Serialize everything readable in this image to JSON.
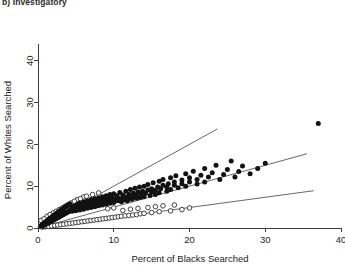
{
  "panel": {
    "title": "b) Investigatory"
  },
  "chart_data": {
    "type": "scatter",
    "title": "b) Investigatory",
    "xlabel": "Percent of Blacks Searched",
    "ylabel": "Percent of Whites Searched",
    "xlim": [
      0,
      40
    ],
    "ylim": [
      0,
      44
    ],
    "xticks": [
      0,
      10,
      20,
      30,
      40
    ],
    "yticks": [
      0,
      10,
      20,
      30,
      40
    ],
    "xtick_labels": [
      "0",
      "10",
      "20",
      "30",
      "40"
    ],
    "ytick_labels": [
      "0",
      "10",
      "20",
      "30",
      "40"
    ],
    "grid": false,
    "legend": null,
    "reference_lines": [
      {
        "name": "upper-line",
        "slope": 1.0,
        "intercept": 0.0,
        "x_start": 0.0,
        "x_end": 23.7
      },
      {
        "name": "middle-line",
        "slope": 0.5,
        "intercept": 0.0,
        "x_start": 0.0,
        "x_end": 35.5
      },
      {
        "name": "lower-line",
        "slope": 0.245,
        "intercept": 0.0,
        "x_start": 0.0,
        "x_end": 36.4
      }
    ],
    "series": [
      {
        "name": "filled-points",
        "marker": "filled-circle",
        "color": "#121212",
        "points": [
          [
            0.3,
            0.3
          ],
          [
            0.4,
            0.5
          ],
          [
            0.5,
            0.4
          ],
          [
            0.5,
            0.7
          ],
          [
            0.6,
            0.5
          ],
          [
            0.6,
            0.9
          ],
          [
            0.7,
            0.6
          ],
          [
            0.7,
            1.0
          ],
          [
            0.8,
            0.7
          ],
          [
            0.8,
            1.1
          ],
          [
            0.9,
            0.8
          ],
          [
            0.9,
            1.3
          ],
          [
            1.0,
            0.9
          ],
          [
            1.0,
            1.4
          ],
          [
            1.1,
            1.0
          ],
          [
            1.1,
            1.6
          ],
          [
            1.2,
            1.1
          ],
          [
            1.2,
            1.7
          ],
          [
            1.3,
            1.2
          ],
          [
            1.3,
            1.9
          ],
          [
            1.4,
            1.3
          ],
          [
            1.4,
            2.0
          ],
          [
            1.5,
            1.4
          ],
          [
            1.5,
            2.2
          ],
          [
            1.6,
            1.5
          ],
          [
            1.6,
            2.3
          ],
          [
            1.7,
            1.6
          ],
          [
            1.7,
            2.4
          ],
          [
            1.8,
            1.7
          ],
          [
            1.8,
            2.6
          ],
          [
            1.9,
            1.8
          ],
          [
            1.9,
            2.7
          ],
          [
            2.0,
            1.9
          ],
          [
            2.0,
            2.9
          ],
          [
            2.1,
            2.0
          ],
          [
            2.1,
            3.0
          ],
          [
            2.2,
            2.1
          ],
          [
            2.2,
            3.1
          ],
          [
            2.3,
            2.2
          ],
          [
            2.3,
            3.3
          ],
          [
            2.4,
            2.3
          ],
          [
            2.4,
            3.4
          ],
          [
            2.5,
            2.4
          ],
          [
            2.5,
            3.5
          ],
          [
            2.6,
            2.5
          ],
          [
            2.6,
            3.7
          ],
          [
            2.7,
            2.6
          ],
          [
            2.7,
            3.8
          ],
          [
            2.8,
            2.7
          ],
          [
            2.8,
            3.9
          ],
          [
            2.9,
            2.8
          ],
          [
            2.9,
            4.1
          ],
          [
            3.0,
            2.9
          ],
          [
            3.0,
            4.2
          ],
          [
            3.1,
            3.0
          ],
          [
            3.1,
            4.3
          ],
          [
            3.2,
            3.1
          ],
          [
            3.2,
            4.5
          ],
          [
            3.3,
            3.2
          ],
          [
            3.3,
            4.6
          ],
          [
            3.4,
            3.3
          ],
          [
            3.4,
            4.7
          ],
          [
            3.5,
            3.4
          ],
          [
            3.5,
            4.9
          ],
          [
            3.6,
            3.5
          ],
          [
            3.6,
            5.0
          ],
          [
            3.7,
            3.6
          ],
          [
            3.7,
            5.1
          ],
          [
            3.8,
            3.7
          ],
          [
            3.8,
            5.3
          ],
          [
            3.9,
            3.8
          ],
          [
            3.9,
            5.4
          ],
          [
            4.0,
            3.9
          ],
          [
            4.0,
            5.5
          ],
          [
            4.1,
            4.0
          ],
          [
            4.2,
            4.2
          ],
          [
            4.2,
            5.8
          ],
          [
            4.3,
            4.3
          ],
          [
            4.4,
            4.5
          ],
          [
            4.5,
            4.0
          ],
          [
            4.5,
            5.2
          ],
          [
            4.6,
            4.7
          ],
          [
            4.7,
            4.2
          ],
          [
            4.8,
            5.0
          ],
          [
            4.9,
            4.4
          ],
          [
            5.0,
            5.4
          ],
          [
            5.0,
            4.1
          ],
          [
            5.1,
            4.8
          ],
          [
            5.2,
            5.6
          ],
          [
            5.3,
            4.5
          ],
          [
            5.4,
            5.2
          ],
          [
            5.5,
            6.0
          ],
          [
            5.5,
            4.3
          ],
          [
            5.6,
            5.0
          ],
          [
            5.7,
            5.8
          ],
          [
            5.8,
            4.7
          ],
          [
            5.9,
            5.4
          ],
          [
            6.0,
            6.2
          ],
          [
            6.0,
            4.5
          ],
          [
            6.1,
            5.2
          ],
          [
            6.2,
            6.0
          ],
          [
            6.3,
            4.9
          ],
          [
            6.4,
            5.6
          ],
          [
            6.5,
            6.5
          ],
          [
            6.5,
            4.7
          ],
          [
            6.6,
            5.4
          ],
          [
            6.7,
            6.2
          ],
          [
            6.8,
            5.1
          ],
          [
            6.9,
            5.8
          ],
          [
            7.0,
            6.8
          ],
          [
            7.0,
            4.9
          ],
          [
            7.1,
            5.6
          ],
          [
            7.2,
            6.4
          ],
          [
            7.3,
            5.3
          ],
          [
            7.4,
            6.0
          ],
          [
            7.5,
            7.0
          ],
          [
            7.5,
            5.1
          ],
          [
            7.6,
            5.8
          ],
          [
            7.7,
            6.6
          ],
          [
            7.8,
            5.5
          ],
          [
            7.9,
            6.2
          ],
          [
            8.0,
            7.2
          ],
          [
            8.0,
            5.3
          ],
          [
            8.1,
            6.0
          ],
          [
            8.2,
            6.8
          ],
          [
            8.3,
            5.7
          ],
          [
            8.4,
            6.4
          ],
          [
            8.5,
            7.5
          ],
          [
            8.5,
            5.5
          ],
          [
            8.6,
            6.2
          ],
          [
            8.7,
            7.0
          ],
          [
            8.8,
            5.9
          ],
          [
            8.9,
            6.6
          ],
          [
            9.0,
            7.7
          ],
          [
            9.0,
            5.7
          ],
          [
            9.1,
            6.4
          ],
          [
            9.2,
            7.2
          ],
          [
            9.3,
            6.1
          ],
          [
            9.4,
            6.8
          ],
          [
            9.5,
            8.0
          ],
          [
            9.5,
            5.9
          ],
          [
            9.6,
            6.6
          ],
          [
            9.7,
            7.5
          ],
          [
            9.8,
            6.3
          ],
          [
            9.9,
            7.0
          ],
          [
            10.0,
            8.2
          ],
          [
            10.0,
            6.1
          ],
          [
            10.2,
            6.8
          ],
          [
            10.4,
            7.7
          ],
          [
            10.5,
            6.5
          ],
          [
            10.6,
            7.2
          ],
          [
            10.8,
            8.5
          ],
          [
            11.0,
            6.3
          ],
          [
            11.0,
            7.0
          ],
          [
            11.2,
            7.9
          ],
          [
            11.4,
            6.7
          ],
          [
            11.5,
            7.4
          ],
          [
            11.6,
            8.8
          ],
          [
            11.8,
            6.5
          ],
          [
            12.0,
            7.2
          ],
          [
            12.0,
            8.1
          ],
          [
            12.2,
            9.2
          ],
          [
            12.4,
            6.9
          ],
          [
            12.5,
            7.6
          ],
          [
            12.6,
            8.3
          ],
          [
            12.8,
            9.5
          ],
          [
            13.0,
            7.1
          ],
          [
            13.0,
            7.8
          ],
          [
            13.2,
            8.6
          ],
          [
            13.4,
            9.8
          ],
          [
            13.5,
            7.3
          ],
          [
            13.6,
            8.0
          ],
          [
            13.8,
            8.8
          ],
          [
            14.0,
            10.0
          ],
          [
            14.0,
            7.5
          ],
          [
            14.2,
            8.3
          ],
          [
            14.5,
            9.1
          ],
          [
            14.5,
            10.4
          ],
          [
            14.8,
            7.8
          ],
          [
            15.0,
            8.6
          ],
          [
            15.0,
            9.4
          ],
          [
            15.2,
            10.8
          ],
          [
            15.5,
            8.0
          ],
          [
            15.5,
            9.0
          ],
          [
            15.8,
            9.8
          ],
          [
            16.0,
            11.2
          ],
          [
            16.0,
            8.4
          ],
          [
            16.2,
            9.4
          ],
          [
            16.5,
            10.2
          ],
          [
            16.5,
            11.6
          ],
          [
            17.0,
            8.8
          ],
          [
            17.0,
            9.8
          ],
          [
            17.2,
            10.6
          ],
          [
            17.5,
            12.0
          ],
          [
            17.5,
            9.2
          ],
          [
            18.0,
            10.2
          ],
          [
            18.0,
            11.0
          ],
          [
            18.2,
            12.5
          ],
          [
            18.5,
            9.6
          ],
          [
            19.0,
            10.6
          ],
          [
            19.0,
            11.5
          ],
          [
            19.5,
            13.0
          ],
          [
            19.5,
            10.0
          ],
          [
            20.0,
            11.0
          ],
          [
            20.0,
            12.0
          ],
          [
            20.5,
            13.6
          ],
          [
            21.0,
            10.5
          ],
          [
            21.0,
            11.6
          ],
          [
            21.5,
            12.6
          ],
          [
            22.0,
            14.2
          ],
          [
            22.0,
            11.0
          ],
          [
            22.5,
            12.2
          ],
          [
            23.0,
            13.2
          ],
          [
            23.5,
            15.0
          ],
          [
            24.0,
            11.6
          ],
          [
            24.5,
            12.8
          ],
          [
            25.0,
            14.0
          ],
          [
            25.5,
            16.0
          ],
          [
            26.0,
            12.2
          ],
          [
            26.5,
            13.5
          ],
          [
            27.0,
            14.8
          ],
          [
            28.0,
            13.0
          ],
          [
            29.0,
            14.2
          ],
          [
            30.0,
            15.5
          ],
          [
            37.0,
            25.0
          ]
        ]
      },
      {
        "name": "open-points",
        "marker": "open-circle",
        "color": "#ffffff",
        "points": [
          [
            0.6,
            0.2
          ],
          [
            1.0,
            0.3
          ],
          [
            1.4,
            0.4
          ],
          [
            1.8,
            0.5
          ],
          [
            2.2,
            0.6
          ],
          [
            2.6,
            0.7
          ],
          [
            3.0,
            0.8
          ],
          [
            3.4,
            0.9
          ],
          [
            3.8,
            1.0
          ],
          [
            4.2,
            1.1
          ],
          [
            4.6,
            1.2
          ],
          [
            5.0,
            1.3
          ],
          [
            5.4,
            1.4
          ],
          [
            5.8,
            1.5
          ],
          [
            6.2,
            1.6
          ],
          [
            6.6,
            1.7
          ],
          [
            7.0,
            1.8
          ],
          [
            7.4,
            1.9
          ],
          [
            7.8,
            2.0
          ],
          [
            8.2,
            2.1
          ],
          [
            8.6,
            2.2
          ],
          [
            9.0,
            2.3
          ],
          [
            9.4,
            2.4
          ],
          [
            9.8,
            2.5
          ],
          [
            10.2,
            2.6
          ],
          [
            10.6,
            2.7
          ],
          [
            11.0,
            2.8
          ],
          [
            11.5,
            2.9
          ],
          [
            12.0,
            3.0
          ],
          [
            12.5,
            3.1
          ],
          [
            13.0,
            3.2
          ],
          [
            13.5,
            3.4
          ],
          [
            14.0,
            3.5
          ],
          [
            15.0,
            3.7
          ],
          [
            16.0,
            3.9
          ],
          [
            17.5,
            4.1
          ],
          [
            19.0,
            4.4
          ],
          [
            1.2,
            2.8
          ],
          [
            2.0,
            3.6
          ],
          [
            2.8,
            4.4
          ],
          [
            3.6,
            5.2
          ],
          [
            4.4,
            6.0
          ],
          [
            5.2,
            6.8
          ],
          [
            6.0,
            7.4
          ],
          [
            7.2,
            8.0
          ],
          [
            0.4,
            1.8
          ],
          [
            0.8,
            2.2
          ],
          [
            1.6,
            3.2
          ],
          [
            2.4,
            4.0
          ],
          [
            3.2,
            4.8
          ],
          [
            4.0,
            5.6
          ],
          [
            4.8,
            6.4
          ],
          [
            5.6,
            7.0
          ],
          [
            6.4,
            7.6
          ],
          [
            8.0,
            8.4
          ],
          [
            9.2,
            4.6
          ],
          [
            10.0,
            4.8
          ],
          [
            11.2,
            4.2
          ],
          [
            12.2,
            4.5
          ],
          [
            13.2,
            4.7
          ],
          [
            14.5,
            4.9
          ],
          [
            15.5,
            5.1
          ],
          [
            16.5,
            5.3
          ],
          [
            18.0,
            5.5
          ],
          [
            20.0,
            4.8
          ]
        ]
      }
    ]
  },
  "axes": {
    "x_title": "Percent of Blacks Searched",
    "y_title": "Percent of Whites Searched"
  }
}
